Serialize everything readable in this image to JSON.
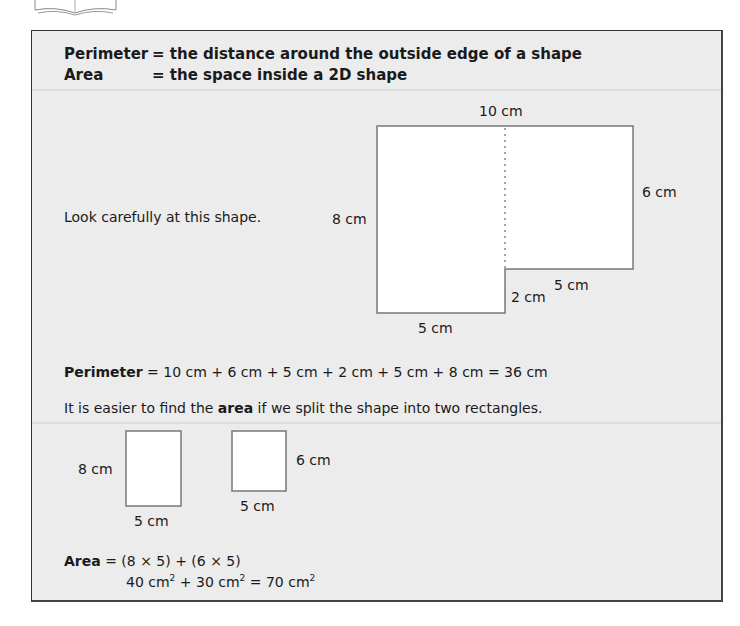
{
  "definitions": [
    {
      "term": "Perimeter",
      "meaning": "= the distance around the outside edge of a shape"
    },
    {
      "term": "Area",
      "meaning": "= the space inside a 2D shape"
    }
  ],
  "instruction": "Look carefully at this shape.",
  "shape_labels": {
    "top": "10 cm",
    "right": "6 cm",
    "left": "8 cm",
    "inner_horizontal": "5 cm",
    "inner_vertical": "2 cm",
    "bottom": "5 cm"
  },
  "perimeter": {
    "label": "Perimeter",
    "equation": " = 10 cm + 6 cm + 5 cm + 2 cm + 5 cm + 8 cm = 36 cm"
  },
  "split_sentence": {
    "before": "It is easier to find the ",
    "bold": "area",
    "after": " if we split the shape into two rectangles."
  },
  "rectangles": [
    {
      "height_label": "8 cm",
      "width_label": "5 cm"
    },
    {
      "height_label": "6 cm",
      "width_label": "5 cm"
    }
  ],
  "area": {
    "label": "Area",
    "line1": " = (8 × 5) + (6 × 5)",
    "line2_parts": [
      "40 cm",
      "2",
      " + 30 cm",
      "2",
      " = 70 cm",
      "2"
    ]
  }
}
